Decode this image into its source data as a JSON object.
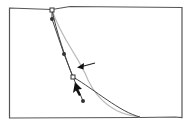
{
  "diagram": {
    "type": "bezier-path-editing",
    "frame": {
      "x": 9,
      "y": 7,
      "width": 173,
      "height": 111,
      "stroke": "#555555"
    },
    "colors": {
      "frame": "#555555",
      "path_dark": "#444444",
      "path_light": "#bbbbbb",
      "handle_line": "#444444",
      "anchor_fill": "#ffffff",
      "handle_dot": "#333333",
      "arrow": "#111111"
    },
    "anchors": [
      {
        "name": "top-anchor",
        "x": 52,
        "y": 10,
        "style": "hollow-square"
      },
      {
        "name": "mid-anchor",
        "x": 73,
        "y": 77,
        "style": "hollow-square"
      }
    ],
    "handles": [
      {
        "name": "top-handle",
        "x": 52,
        "y": 19
      },
      {
        "name": "upper-mid-handle",
        "x": 64,
        "y": 54
      },
      {
        "name": "lower-handle",
        "x": 83,
        "y": 101
      }
    ],
    "pointer_arrow": {
      "from": [
        95,
        63
      ],
      "to": [
        78,
        67
      ]
    },
    "cursor": {
      "x": 75,
      "y": 83,
      "type": "selection-arrow"
    }
  }
}
